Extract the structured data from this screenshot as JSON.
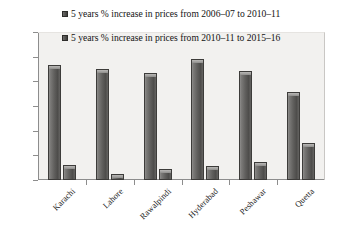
{
  "chart_data": {
    "type": "bar",
    "title": "",
    "xlabel": "",
    "ylabel": "",
    "ylim": [
      0,
      120
    ],
    "yticks": [
      0,
      20,
      40,
      60,
      80,
      100,
      120
    ],
    "grid": false,
    "legend_position": "top-center-inside",
    "categories": [
      "Karachi",
      "Lahore",
      "Rawalpindi",
      "Hyderabad",
      "Peshawar",
      "Quetta"
    ],
    "series": [
      {
        "name": "5 years % increase in prices from 2006–07 to 2010–11",
        "color": "#5a5957",
        "values": [
          93,
          90,
          87,
          98,
          88,
          71
        ]
      },
      {
        "name": "5 years % increase in prices from 2010–11 to 2015–16",
        "color": "#5a5957",
        "values": [
          12,
          5,
          9,
          11,
          15,
          30
        ]
      }
    ]
  },
  "legend": {
    "items": [
      {
        "marker": "square-swatch-icon",
        "label": "5 years % increase in prices from 2006–07 to 2010–11"
      },
      {
        "marker": "square-swatch-icon",
        "label": "5 years % increase in prices from 2010–11 to 2015–16"
      }
    ]
  },
  "axes": {
    "y": {
      "ticks": [
        "0",
        "20",
        "40",
        "60",
        "80",
        "100",
        "120"
      ]
    },
    "x": {
      "ticks": [
        "Karachi",
        "Lahore",
        "Rawalpindi",
        "Hyderabad",
        "Peshawar",
        "Quetta"
      ]
    }
  }
}
